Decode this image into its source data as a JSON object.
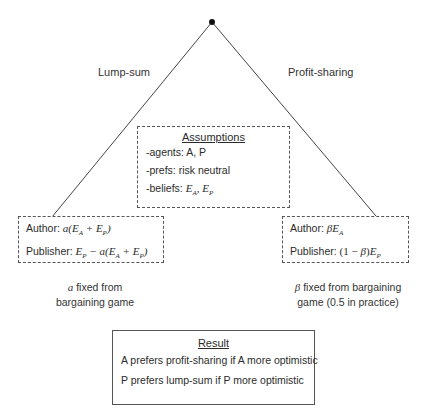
{
  "tree": {
    "root_node": "decision-node",
    "left_branch": {
      "label": "Lump-sum"
    },
    "right_branch": {
      "label": "Profit-sharing"
    }
  },
  "assumptions": {
    "title": "Assumptions",
    "items": [
      {
        "label": "-agents: ",
        "value": "A, P"
      },
      {
        "label": "-prefs: ",
        "value": "risk neutral"
      },
      {
        "label": "-beliefs: ",
        "math": "E_A, E_P"
      }
    ]
  },
  "lump_sum_payoffs": {
    "author_label": "Author: ",
    "author_formula": "a(E_A + E_P)",
    "publisher_label": "Publisher: ",
    "publisher_formula": "E_P − a(E_A + E_P)",
    "note_line1": "a fixed from",
    "note_line2": "bargaining game",
    "note_symbol": "a"
  },
  "profit_sharing_payoffs": {
    "author_label": "Author: ",
    "author_formula": "βE_A",
    "publisher_label": "Publisher: ",
    "publisher_formula": "(1 − β)E_P",
    "note_line1": "β fixed from bargaining",
    "note_line2": "game (0.5 in practice)",
    "note_symbol": "β"
  },
  "result": {
    "title": "Result",
    "lines": [
      "A prefers profit-sharing if A more optimistic",
      "P prefers lump-sum if P more optimistic"
    ]
  },
  "colors": {
    "line": "#444444",
    "text": "#2b2b2b",
    "background": "#ffffff"
  }
}
